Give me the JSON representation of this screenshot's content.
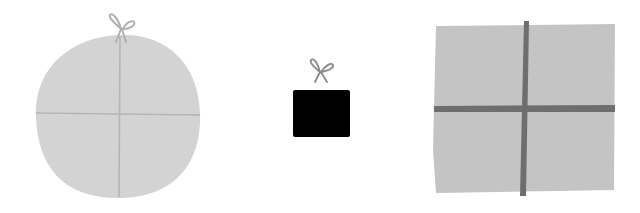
{
  "scene": {
    "description": "Three gift illustrations",
    "background": "#ffffff",
    "gifts": [
      {
        "name": "round-gift",
        "fill": "#d3d3d3",
        "ribbon": "#b3b3b3",
        "bow": "#b0b0b0"
      },
      {
        "name": "small-black-gift",
        "fill": "#000000",
        "bow": "#8a8a8a"
      },
      {
        "name": "square-gift",
        "fill": "#c4c4c4",
        "ribbon": "#6e6e6e"
      }
    ]
  }
}
